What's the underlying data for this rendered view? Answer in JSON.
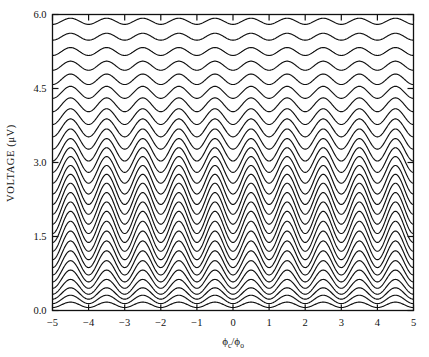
{
  "figure": {
    "name": "squid-voltage-flux-characteristics",
    "background": "#ffffff",
    "line_color": "#111111"
  },
  "axes": {
    "x": {
      "label_parts": {
        "numerator_symbol": "ϕ",
        "numerator_subscript": "c",
        "separator": "/",
        "denominator_symbol": "ϕ",
        "denominator_subscript": "o"
      },
      "label_plain": "ϕc/ϕo",
      "min": -5,
      "max": 5,
      "ticks": [
        -5,
        -4,
        -3,
        -2,
        -1,
        0,
        1,
        2,
        3,
        4,
        5
      ],
      "tick_labels": [
        "−5",
        "−4",
        "−3",
        "−2",
        "−1",
        "0",
        "1",
        "2",
        "3",
        "4",
        "5"
      ]
    },
    "y": {
      "label": "VOLTAGE (μV)",
      "min": 0.0,
      "max": 6.0,
      "ticks": [
        0.0,
        1.5,
        3.0,
        4.5,
        6.0
      ],
      "tick_labels": [
        "0.0",
        "1.5",
        "3.0",
        "4.5",
        "6.0"
      ]
    }
  },
  "chart_data": {
    "type": "line",
    "title": "",
    "subtitle": "",
    "xlabel": "ϕc/ϕo",
    "ylabel": "VOLTAGE (μV)",
    "xlim": [
      -5,
      5
    ],
    "ylim": [
      0.0,
      6.0
    ],
    "grid": false,
    "legend": "none",
    "x_tick_labels": [
      "−5",
      "−4",
      "−3",
      "−2",
      "−1",
      "0",
      "1",
      "2",
      "3",
      "4",
      "5"
    ],
    "y_tick_labels": [
      "0.0",
      "1.5",
      "3.0",
      "4.5",
      "6.0"
    ],
    "n_series": 28,
    "period_in_x_units": 1.0,
    "minima_at_integer_flux": true,
    "series": [
      {
        "name": "curve-01",
        "offset": 0.06,
        "amplitude": 0.055
      },
      {
        "name": "curve-02",
        "offset": 0.14,
        "amplitude": 0.085
      },
      {
        "name": "curve-03",
        "offset": 0.23,
        "amplitude": 0.115
      },
      {
        "name": "curve-04",
        "offset": 0.33,
        "amplitude": 0.15
      },
      {
        "name": "curve-05",
        "offset": 0.45,
        "amplitude": 0.185
      },
      {
        "name": "curve-06",
        "offset": 0.58,
        "amplitude": 0.215
      },
      {
        "name": "curve-07",
        "offset": 0.72,
        "amplitude": 0.245
      },
      {
        "name": "curve-08",
        "offset": 0.87,
        "amplitude": 0.27
      },
      {
        "name": "curve-09",
        "offset": 1.03,
        "amplitude": 0.29
      },
      {
        "name": "curve-10",
        "offset": 1.2,
        "amplitude": 0.305
      },
      {
        "name": "curve-11",
        "offset": 1.38,
        "amplitude": 0.315
      },
      {
        "name": "curve-12",
        "offset": 1.56,
        "amplitude": 0.32
      },
      {
        "name": "curve-13",
        "offset": 1.75,
        "amplitude": 0.32
      },
      {
        "name": "curve-14",
        "offset": 1.95,
        "amplitude": 0.315
      },
      {
        "name": "curve-15",
        "offset": 2.15,
        "amplitude": 0.305
      },
      {
        "name": "curve-16",
        "offset": 2.36,
        "amplitude": 0.29
      },
      {
        "name": "curve-17",
        "offset": 2.58,
        "amplitude": 0.27
      },
      {
        "name": "curve-18",
        "offset": 2.8,
        "amplitude": 0.25
      },
      {
        "name": "curve-19",
        "offset": 3.03,
        "amplitude": 0.228
      },
      {
        "name": "curve-20",
        "offset": 3.27,
        "amplitude": 0.205
      },
      {
        "name": "curve-21",
        "offset": 3.52,
        "amplitude": 0.182
      },
      {
        "name": "curve-22",
        "offset": 3.77,
        "amplitude": 0.16
      },
      {
        "name": "curve-23",
        "offset": 4.03,
        "amplitude": 0.14
      },
      {
        "name": "curve-24",
        "offset": 4.3,
        "amplitude": 0.122
      },
      {
        "name": "curve-25",
        "offset": 4.58,
        "amplitude": 0.106
      },
      {
        "name": "curve-26",
        "offset": 4.87,
        "amplitude": 0.092
      },
      {
        "name": "curve-27",
        "offset": 5.17,
        "amplitude": 0.08
      },
      {
        "name": "curve-28",
        "offset": 5.48,
        "amplitude": 0.07
      },
      {
        "name": "curve-29",
        "offset": 5.8,
        "amplitude": 0.062
      }
    ]
  }
}
